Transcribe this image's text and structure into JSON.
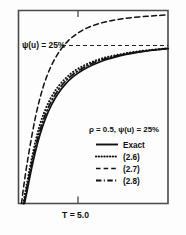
{
  "chart_data": {
    "type": "line",
    "title": "",
    "xlabel": "T = 5.0",
    "ylabel": "",
    "xlim": [
      0,
      1
    ],
    "ylim": [
      0,
      1
    ],
    "grid": false,
    "legend_position": "lower-right",
    "annotations": [
      {
        "name": "psi-reference-label",
        "text": "ψ(u) = 25%",
        "x": 0.06,
        "y": 0.77
      },
      {
        "name": "x-axis-tick-label",
        "text": "T = 5.0",
        "x": 0.41,
        "y": -0.08
      }
    ],
    "reference_lines": [
      {
        "name": "psi-25-percent-line",
        "orientation": "horizontal",
        "value": 0.75,
        "style": "dashed",
        "label": "ψ(u) = 25%"
      }
    ],
    "ticks": {
      "x": [
        {
          "value": 0.41,
          "label": "T = 5.0"
        }
      ],
      "y": []
    },
    "legend_title": "ρ = 0.5, ψ(u) = 25%",
    "series": [
      {
        "name": "Exact",
        "style": "solid",
        "x": [
          0.04,
          0.055,
          0.07,
          0.09,
          0.115,
          0.145,
          0.18,
          0.22,
          0.265,
          0.315,
          0.37,
          0.43,
          0.495,
          0.565,
          0.64,
          0.72,
          0.805,
          0.895,
          1.0
        ],
        "y": [
          0.0,
          0.055,
          0.115,
          0.19,
          0.275,
          0.36,
          0.44,
          0.51,
          0.57,
          0.62,
          0.66,
          0.692,
          0.718,
          0.74,
          0.757,
          0.772,
          0.784,
          0.794,
          0.803
        ]
      },
      {
        "name": "(2.6)",
        "style": "dotted",
        "x": [
          0.032,
          0.048,
          0.065,
          0.085,
          0.11,
          0.14,
          0.175,
          0.215,
          0.26,
          0.31,
          0.365,
          0.425,
          0.49,
          0.56,
          0.635,
          0.715,
          0.8,
          0.89,
          1.0
        ],
        "y": [
          0.0,
          0.07,
          0.14,
          0.22,
          0.31,
          0.4,
          0.478,
          0.545,
          0.6,
          0.645,
          0.682,
          0.71,
          0.733,
          0.752,
          0.766,
          0.778,
          0.788,
          0.796,
          0.804
        ]
      },
      {
        "name": "(2.7)",
        "style": "dashed",
        "x": [
          0.02,
          0.035,
          0.055,
          0.08,
          0.11,
          0.145,
          0.185,
          0.23,
          0.28,
          0.335,
          0.395,
          0.46,
          0.53,
          0.605,
          0.685,
          0.77,
          0.86,
          0.93,
          1.0
        ],
        "y": [
          0.0,
          0.09,
          0.195,
          0.31,
          0.435,
          0.55,
          0.65,
          0.73,
          0.795,
          0.845,
          0.882,
          0.91,
          0.93,
          0.945,
          0.956,
          0.964,
          0.97,
          0.974,
          0.977
        ]
      },
      {
        "name": "(2.8)",
        "style": "dash-dot",
        "x": [
          0.036,
          0.052,
          0.068,
          0.088,
          0.113,
          0.143,
          0.178,
          0.218,
          0.263,
          0.313,
          0.368,
          0.428,
          0.493,
          0.563,
          0.638,
          0.718,
          0.803,
          0.893,
          1.0
        ],
        "y": [
          0.0,
          0.062,
          0.128,
          0.205,
          0.292,
          0.378,
          0.458,
          0.527,
          0.585,
          0.633,
          0.671,
          0.701,
          0.726,
          0.746,
          0.762,
          0.775,
          0.786,
          0.795,
          0.803
        ]
      }
    ],
    "legend": [
      {
        "label": "Exact",
        "style": "solid"
      },
      {
        "label": "(2.6)",
        "style": "dotted"
      },
      {
        "label": "(2.7)",
        "style": "dashed"
      },
      {
        "label": "(2.8)",
        "style": "dash-dot"
      }
    ]
  },
  "axes": {
    "frame_color": "#4a4a4a",
    "background": "#ffffff"
  }
}
